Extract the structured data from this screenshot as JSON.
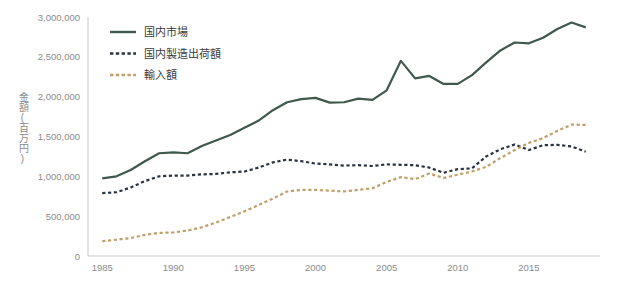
{
  "chart_data": {
    "type": "line",
    "title": "",
    "xlabel": "",
    "ylabel": "金額(百万円)",
    "xlim": [
      1984,
      2020
    ],
    "ylim": [
      0,
      3000000
    ],
    "grid": false,
    "legend_position": "top-left",
    "x": [
      1985,
      1986,
      1987,
      1988,
      1989,
      1990,
      1991,
      1992,
      1993,
      1994,
      1995,
      1996,
      1997,
      1998,
      1999,
      2000,
      2001,
      2002,
      2003,
      2004,
      2005,
      2006,
      2007,
      2008,
      2009,
      2010,
      2011,
      2012,
      2013,
      2014,
      2015,
      2016,
      2017,
      2018,
      2019
    ],
    "xtick_labels": [
      "1985",
      "1990",
      "1995",
      "2000",
      "2005",
      "2010",
      "2015"
    ],
    "xticks": [
      1985,
      1990,
      1995,
      2000,
      2005,
      2010,
      2015
    ],
    "ytick_labels": [
      "0",
      "500,000",
      "1,000,000",
      "1,500,000",
      "2,000,000",
      "2,500,000",
      "3,000,000"
    ],
    "yticks": [
      0,
      500000,
      1000000,
      1500000,
      2000000,
      2500000,
      3000000
    ],
    "series": [
      {
        "name": "国内市場",
        "color": "#3d5a4c",
        "style": "solid",
        "values": [
          975000,
          1000000,
          1080000,
          1190000,
          1290000,
          1300000,
          1290000,
          1380000,
          1450000,
          1520000,
          1610000,
          1700000,
          1830000,
          1930000,
          1970000,
          1985000,
          1925000,
          1930000,
          1975000,
          1960000,
          2080000,
          2450000,
          2230000,
          2260000,
          2160000,
          2160000,
          2270000,
          2430000,
          2580000,
          2680000,
          2670000,
          2740000,
          2850000,
          2930000,
          2870000
        ]
      },
      {
        "name": "国内製造出荷額",
        "color": "#2b3340",
        "style": "dashed",
        "values": [
          790000,
          800000,
          860000,
          940000,
          1000000,
          1010000,
          1010000,
          1025000,
          1030000,
          1050000,
          1060000,
          1110000,
          1175000,
          1210000,
          1190000,
          1160000,
          1150000,
          1135000,
          1140000,
          1130000,
          1150000,
          1145000,
          1140000,
          1110000,
          1045000,
          1090000,
          1100000,
          1250000,
          1340000,
          1400000,
          1330000,
          1390000,
          1395000,
          1375000,
          1310000
        ]
      },
      {
        "name": "輸入額",
        "color": "#bfa06a",
        "style": "dashed",
        "values": [
          185000,
          205000,
          225000,
          265000,
          290000,
          295000,
          320000,
          360000,
          420000,
          490000,
          560000,
          640000,
          720000,
          810000,
          830000,
          830000,
          820000,
          810000,
          830000,
          850000,
          930000,
          990000,
          965000,
          1035000,
          980000,
          1020000,
          1060000,
          1120000,
          1230000,
          1330000,
          1420000,
          1480000,
          1570000,
          1650000,
          1645000
        ]
      }
    ]
  },
  "legend": {
    "items": [
      {
        "label": "国内市場"
      },
      {
        "label": "国内製造出荷額"
      },
      {
        "label": "輸入額"
      }
    ]
  },
  "colors": {
    "domestic_market": "#3d5a4c",
    "domestic_shipment": "#2b3340",
    "imports": "#bfa06a",
    "axis": "#c9c9c9",
    "tick_text": "#8a8a8a"
  }
}
